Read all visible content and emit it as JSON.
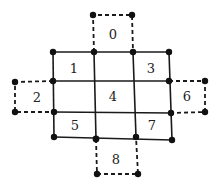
{
  "diagram": {
    "cells": [
      {
        "id": "0",
        "label": "0"
      },
      {
        "id": "1",
        "label": "1"
      },
      {
        "id": "2",
        "label": "2"
      },
      {
        "id": "3",
        "label": "3"
      },
      {
        "id": "4",
        "label": "4"
      },
      {
        "id": "5",
        "label": "5"
      },
      {
        "id": "6",
        "label": "6"
      },
      {
        "id": "7",
        "label": "7"
      },
      {
        "id": "8",
        "label": "8"
      }
    ]
  }
}
